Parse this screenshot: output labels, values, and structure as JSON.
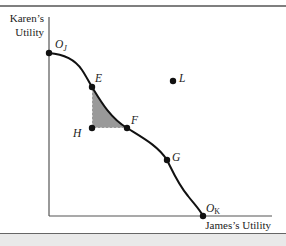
{
  "figure": {
    "type": "utility-possibilities-frontier",
    "y_axis_label_line1": "Karen’s",
    "y_axis_label_line2": "Utility",
    "x_axis_label": "James’s Utility",
    "colors": {
      "line": "#111111",
      "axis": "#555555",
      "shade": "#999999",
      "footer": "#e9e9e9"
    },
    "points": [
      {
        "id": "OJ",
        "label": "O",
        "sub": "J",
        "on_curve": true
      },
      {
        "id": "E",
        "label": "E",
        "on_curve": true
      },
      {
        "id": "F",
        "label": "F",
        "on_curve": true
      },
      {
        "id": "G",
        "label": "G",
        "on_curve": true
      },
      {
        "id": "OK",
        "label": "O",
        "sub": "K",
        "on_curve": true
      },
      {
        "id": "H",
        "label": "H",
        "on_curve": false
      },
      {
        "id": "L",
        "label": "L",
        "on_curve": false
      }
    ],
    "shaded_region": "Area bounded by E, H, F and the frontier curve"
  }
}
